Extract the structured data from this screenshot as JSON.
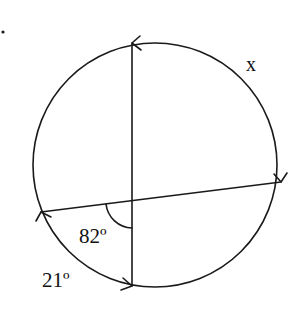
{
  "diagram": {
    "type": "circle-secants",
    "stroke_color": "#1a1a1a",
    "labels": {
      "arc_x": "x",
      "angle_82": "82º",
      "arc_21": "21º"
    },
    "circle": {
      "cx": 155,
      "cy": 165,
      "r": 122
    },
    "vertical_chord": {
      "x1": 132,
      "y1": 43,
      "x2": 132,
      "y2": 286
    },
    "slanted_chord": {
      "x1": 41,
      "y1": 212,
      "x2": 281,
      "y2": 182
    },
    "intersection": {
      "x": 132,
      "y": 200.6
    },
    "marker_dot": {
      "x": 3,
      "y": 32
    }
  }
}
